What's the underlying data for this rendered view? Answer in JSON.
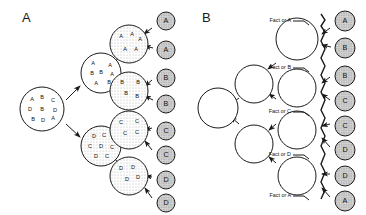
{
  "figure": {
    "panels": [
      {
        "id": "A",
        "label": "A",
        "root": {
          "name": "root-pool",
          "cx": 42,
          "cy": 109,
          "r": 22,
          "fill": "open",
          "letters": [
            {
              "t": "A",
              "x": 32,
              "y": 100
            },
            {
              "t": "B",
              "x": 42,
              "y": 98
            },
            {
              "t": "C",
              "x": 53,
              "y": 101
            },
            {
              "t": "D",
              "x": 30,
              "y": 110
            },
            {
              "t": "B",
              "x": 42,
              "y": 110
            },
            {
              "t": "D",
              "x": 55,
              "y": 111
            },
            {
              "t": "B",
              "x": 33,
              "y": 120
            },
            {
              "t": "D",
              "x": 43,
              "y": 121
            },
            {
              "t": "A",
              "x": 53,
              "y": 119
            }
          ]
        },
        "mid": [
          {
            "name": "mid-pool-ab",
            "cx": 101,
            "cy": 73,
            "r": 20,
            "fill": "open",
            "letters": [
              {
                "t": "A",
                "x": 93,
                "y": 64
              },
              {
                "t": "A",
                "x": 110,
                "y": 66
              },
              {
                "t": "B",
                "x": 92,
                "y": 74
              },
              {
                "t": "B",
                "x": 101,
                "y": 73
              },
              {
                "t": "A",
                "x": 112,
                "y": 75
              },
              {
                "t": "A",
                "x": 96,
                "y": 84
              },
              {
                "t": "B",
                "x": 109,
                "y": 83
              }
            ]
          },
          {
            "name": "mid-pool-cd",
            "cx": 101,
            "cy": 146,
            "r": 20,
            "fill": "dots",
            "letters": [
              {
                "t": "D",
                "x": 94,
                "y": 137
              },
              {
                "t": "C",
                "x": 104,
                "y": 136
              },
              {
                "t": "D",
                "x": 113,
                "y": 138
              },
              {
                "t": "C",
                "x": 90,
                "y": 147
              },
              {
                "t": "D",
                "x": 101,
                "y": 147
              },
              {
                "t": "C",
                "x": 112,
                "y": 148
              },
              {
                "t": "D",
                "x": 96,
                "y": 157
              },
              {
                "t": "C",
                "x": 107,
                "y": 157
              }
            ]
          }
        ],
        "clones": [
          {
            "name": "clone-pool-a",
            "cx": 129,
            "cy": 44,
            "r": 19,
            "fill": "dots",
            "letters": [
              {
                "t": "A",
                "x": 121,
                "y": 37
              },
              {
                "t": "A",
                "x": 132,
                "y": 35
              },
              {
                "t": "A",
                "x": 140,
                "y": 40
              },
              {
                "t": "A",
                "x": 125,
                "y": 50
              },
              {
                "t": "A",
                "x": 136,
                "y": 50
              }
            ]
          },
          {
            "name": "clone-pool-b",
            "cx": 129,
            "cy": 91,
            "r": 19,
            "fill": "dots",
            "letters": [
              {
                "t": "B",
                "x": 122,
                "y": 83
              },
              {
                "t": "B",
                "x": 138,
                "y": 83
              },
              {
                "t": "B",
                "x": 126,
                "y": 94
              },
              {
                "t": "B",
                "x": 137,
                "y": 97
              }
            ]
          },
          {
            "name": "clone-pool-c",
            "cx": 129,
            "cy": 130,
            "r": 19,
            "fill": "dots",
            "letters": [
              {
                "t": "C",
                "x": 121,
                "y": 123
              },
              {
                "t": "C",
                "x": 137,
                "y": 122
              },
              {
                "t": "C",
                "x": 125,
                "y": 134
              },
              {
                "t": "C",
                "x": 137,
                "y": 133
              }
            ]
          },
          {
            "name": "clone-pool-d",
            "cx": 129,
            "cy": 176,
            "r": 19,
            "fill": "dots",
            "letters": [
              {
                "t": "D",
                "x": 121,
                "y": 169
              },
              {
                "t": "D",
                "x": 133,
                "y": 168
              },
              {
                "t": "D",
                "x": 127,
                "y": 180
              },
              {
                "t": "D",
                "x": 138,
                "y": 178
              }
            ]
          }
        ],
        "leaves": [
          {
            "name": "leaf-a-1",
            "label": "A",
            "cx": 166,
            "cy": 21,
            "r": 9
          },
          {
            "name": "leaf-a-2",
            "label": "A",
            "cx": 166,
            "cy": 50,
            "r": 9
          },
          {
            "name": "leaf-b-1",
            "label": "B",
            "cx": 166,
            "cy": 78,
            "r": 9
          },
          {
            "name": "leaf-b-2",
            "label": "B",
            "cx": 166,
            "cy": 104,
            "r": 9
          },
          {
            "name": "leaf-c-1",
            "label": "C",
            "cx": 166,
            "cy": 131,
            "r": 9
          },
          {
            "name": "leaf-c-2",
            "label": "C",
            "cx": 166,
            "cy": 155,
            "r": 9
          },
          {
            "name": "leaf-d-1",
            "label": "D",
            "cx": 166,
            "cy": 180,
            "r": 9
          },
          {
            "name": "leaf-d-2",
            "label": "D",
            "cx": 166,
            "cy": 203,
            "r": 9
          }
        ],
        "edges": [
          {
            "name": "edge-root-to-ab",
            "x1": 66,
            "y1": 100,
            "x2": 80,
            "y2": 86
          },
          {
            "name": "edge-root-to-cd",
            "x1": 66,
            "y1": 124,
            "x2": 80,
            "y2": 137
          },
          {
            "name": "edge-ab-to-a",
            "x1": 118,
            "y1": 59,
            "x2": 110,
            "y2": 65
          },
          {
            "name": "edge-ab-to-b",
            "x1": 118,
            "y1": 84,
            "x2": 111,
            "y2": 79
          },
          {
            "name": "edge-cd-to-c",
            "x1": 118,
            "y1": 136,
            "x2": 111,
            "y2": 141
          },
          {
            "name": "edge-cd-to-d",
            "x1": 118,
            "y1": 162,
            "x2": 111,
            "y2": 156
          },
          {
            "name": "edge-a-to-leaf1",
            "x1": 152,
            "y1": 28,
            "x2": 144,
            "y2": 34
          },
          {
            "name": "edge-a-to-leaf2",
            "x1": 153,
            "y1": 48,
            "x2": 145,
            "y2": 46
          },
          {
            "name": "edge-b-to-leaf1",
            "x1": 152,
            "y1": 80,
            "x2": 145,
            "y2": 86
          },
          {
            "name": "edge-b-to-leaf2",
            "x1": 153,
            "y1": 100,
            "x2": 145,
            "y2": 96
          },
          {
            "name": "edge-c-to-leaf1",
            "x1": 152,
            "y1": 128,
            "x2": 145,
            "y2": 130
          },
          {
            "name": "edge-c-to-leaf2",
            "x1": 152,
            "y1": 150,
            "x2": 145,
            "y2": 141
          },
          {
            "name": "edge-d-to-leaf1",
            "x1": 152,
            "y1": 177,
            "x2": 146,
            "y2": 176
          },
          {
            "name": "edge-d-to-leaf2",
            "x1": 152,
            "y1": 198,
            "x2": 145,
            "y2": 188
          }
        ]
      },
      {
        "id": "B",
        "label": "B",
        "root": {
          "name": "root-node",
          "cx": 218,
          "cy": 108,
          "r": 20,
          "fill": "open"
        },
        "mid": [
          {
            "name": "mid-node-upper",
            "cx": 254,
            "cy": 84,
            "r": 19,
            "fill": "open"
          },
          {
            "name": "mid-node-lower",
            "cx": 254,
            "cy": 144,
            "r": 19,
            "fill": "open"
          }
        ],
        "clones": [
          {
            "name": "factor-node-1",
            "cx": 297,
            "cy": 39,
            "r": 21,
            "fill": "open"
          },
          {
            "name": "factor-node-2",
            "cx": 297,
            "cy": 88,
            "r": 19,
            "fill": "open"
          },
          {
            "name": "factor-node-3",
            "cx": 297,
            "cy": 130,
            "r": 19,
            "fill": "open"
          },
          {
            "name": "factor-node-4",
            "cx": 297,
            "cy": 176,
            "r": 19,
            "fill": "open"
          }
        ],
        "factor_labels": [
          {
            "name": "factor-label-a-top",
            "text": "Fact or A",
            "x": 291,
            "y": 21,
            "tx": 297,
            "ty": 21
          },
          {
            "name": "factor-label-b",
            "text": "Fact or B",
            "x": 291,
            "y": 68,
            "tx": 297,
            "ty": 68
          },
          {
            "name": "factor-label-c",
            "text": "Fact or C",
            "x": 291,
            "y": 112,
            "tx": 297,
            "ty": 112
          },
          {
            "name": "factor-label-d",
            "text": "Fact or D",
            "x": 291,
            "y": 155,
            "tx": 297,
            "ty": 155
          },
          {
            "name": "factor-label-a-bottom",
            "text": "Fact or A",
            "x": 291,
            "y": 196,
            "tx": 297,
            "ty": 196
          }
        ],
        "leaves": [
          {
            "name": "leaf-b-a-1",
            "label": "A",
            "cx": 345,
            "cy": 21,
            "r": 10
          },
          {
            "name": "leaf-b-b-1",
            "label": "B",
            "cx": 345,
            "cy": 48,
            "r": 10
          },
          {
            "name": "leaf-b-b-2",
            "label": "B",
            "cx": 345,
            "cy": 76,
            "r": 10
          },
          {
            "name": "leaf-b-c-1",
            "label": "C",
            "cx": 345,
            "cy": 101,
            "r": 10
          },
          {
            "name": "leaf-b-c-2",
            "label": "C",
            "cx": 345,
            "cy": 126,
            "r": 10
          },
          {
            "name": "leaf-b-d-1",
            "label": "D",
            "cx": 345,
            "cy": 150,
            "r": 10
          },
          {
            "name": "leaf-b-d-2",
            "label": "D",
            "cx": 345,
            "cy": 176,
            "r": 10
          },
          {
            "name": "leaf-b-a-2",
            "label": "A",
            "cx": 345,
            "cy": 201,
            "r": 10
          }
        ],
        "edges": [
          {
            "name": "edge-b-root-to-upper",
            "x1": 239,
            "y1": 98,
            "x2": 231,
            "y2": 104
          },
          {
            "name": "edge-b-root-to-lower",
            "x1": 239,
            "y1": 124,
            "x2": 231,
            "y2": 117
          },
          {
            "name": "edge-b-upper-to-f1",
            "x1": 276,
            "y1": 63,
            "x2": 268,
            "y2": 69
          },
          {
            "name": "edge-b-upper-to-f2",
            "x1": 276,
            "y1": 99,
            "x2": 269,
            "y2": 94
          },
          {
            "name": "edge-b-lower-to-f3",
            "x1": 276,
            "y1": 124,
            "x2": 269,
            "y2": 130
          },
          {
            "name": "edge-b-lower-to-f4",
            "x1": 276,
            "y1": 163,
            "x2": 269,
            "y2": 157
          },
          {
            "name": "edge-b-f1-to-leaf1",
            "x1": 330,
            "y1": 28,
            "x2": 322,
            "y2": 34
          },
          {
            "name": "edge-b-f1-to-leaf2",
            "x1": 331,
            "y1": 47,
            "x2": 322,
            "y2": 45
          },
          {
            "name": "edge-b-f2-to-leaf3",
            "x1": 330,
            "y1": 77,
            "x2": 322,
            "y2": 83
          },
          {
            "name": "edge-b-f2-to-leaf4",
            "x1": 330,
            "y1": 100,
            "x2": 322,
            "y2": 94
          },
          {
            "name": "edge-b-f3-to-leaf5",
            "x1": 330,
            "y1": 124,
            "x2": 322,
            "y2": 126
          },
          {
            "name": "edge-b-f3-to-leaf6",
            "x1": 330,
            "y1": 147,
            "x2": 322,
            "y2": 138
          },
          {
            "name": "edge-b-f4-to-leaf7",
            "x1": 330,
            "y1": 174,
            "x2": 322,
            "y2": 174
          },
          {
            "name": "edge-b-f4-to-leaf8",
            "x1": 330,
            "y1": 197,
            "x2": 322,
            "y2": 188
          }
        ],
        "bracket": {
          "name": "factor-bracket",
          "path": "M 321 14 L 325 20 L 321 26 L 325 32 L 321 41 L 325 49 L 321 58 L 325 66 L 321 75 L 325 83 L 321 92 L 325 100 L 321 110 L 325 118 L 321 128 L 325 136 L 321 146 L 325 154 L 321 164 L 325 172 L 321 182 L 325 190 L 321 199"
        }
      }
    ]
  },
  "colors": {
    "leaf_fill": "#c9c9c9",
    "dot_fill": "#f0f0f0",
    "stroke": "#1a1a1a",
    "background": "#ffffff"
  }
}
